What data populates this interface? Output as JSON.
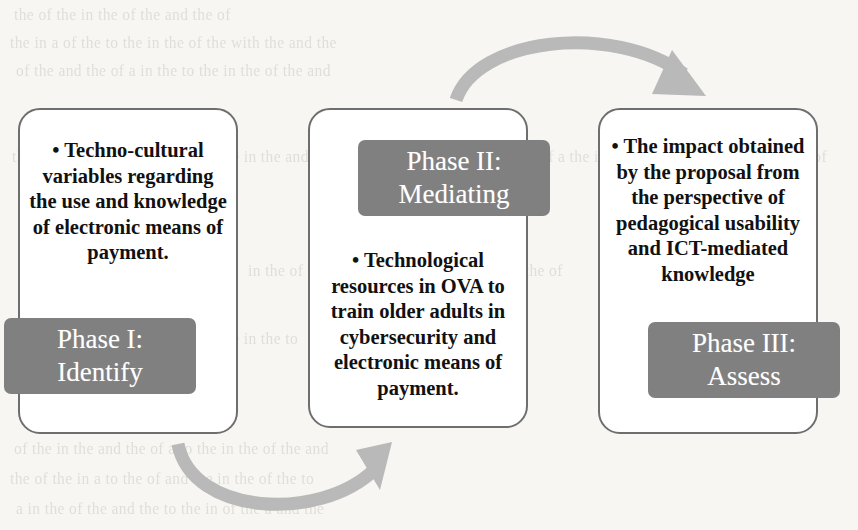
{
  "diagram": {
    "background_color": "#f7f6f3",
    "box_border_color": "#6e6e6e",
    "bar_color": "#808080",
    "bar_text_color": "#ffffff",
    "arrow_color": "#b9b9b9",
    "body_text_color": "#111111"
  },
  "phases": [
    {
      "id": "phase-1",
      "body": "• Techno-cultural variables regarding the use and knowledge of electronic means of payment.",
      "label_line1": "Phase I:",
      "label_line2": "Identify"
    },
    {
      "id": "phase-2",
      "body": "• Technological resources in OVA to train older adults in cybersecurity and electronic means of payment.",
      "label_line1": "Phase II:",
      "label_line2": "Mediating"
    },
    {
      "id": "phase-3",
      "body": "• The impact obtained by the proposal from the perspective of pedagogical usability and ICT-mediated knowledge",
      "label_line1": "Phase III:",
      "label_line2": "Assess"
    }
  ],
  "arrows": [
    {
      "id": "arrow-top",
      "from": "phase-2",
      "to": "phase-3",
      "direction": "up-right-arc"
    },
    {
      "id": "arrow-bottom",
      "from": "phase-1",
      "to": "phase-2",
      "direction": "down-right-arc"
    }
  ],
  "background_ghost_text": {
    "note": "faint bleed-through text from the reverse side of the scanned page",
    "lines": [
      "the of the in the of the and the of",
      "the in a of the to the in the of the with the and the",
      "of the and the of a in the to the in the of the and",
      "the in the of the and a to the of the in the and",
      "of a the in the to the of the and the in the of",
      "in the of the and to the in a of the the and the of",
      "the to the of the and in the a of the in the to",
      "of the in the and the of a to the in the of the and",
      "the of the in a to the of and the in the of the to",
      "a in the of the and the to the in of the a and the"
    ]
  }
}
